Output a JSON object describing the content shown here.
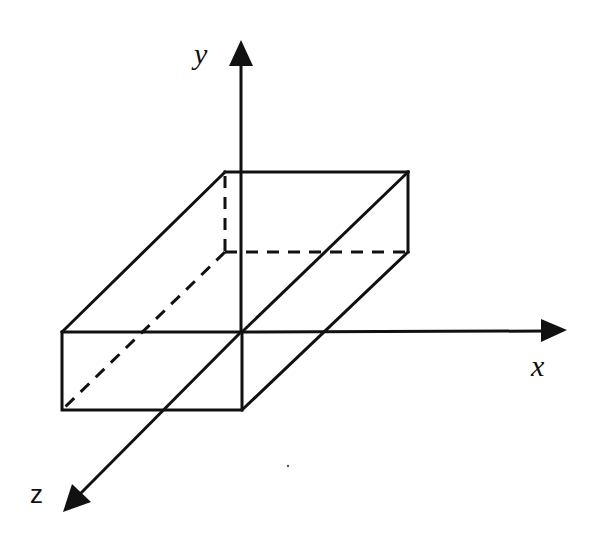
{
  "diagram": {
    "type": "3d-axes-box",
    "axes": {
      "x": {
        "label": "x",
        "icon": "arrow-right-icon"
      },
      "y": {
        "label": "y",
        "icon": "arrow-up-icon"
      },
      "z": {
        "label": "z",
        "icon": "arrow-down-left-icon"
      }
    },
    "shape": "rectangular-box",
    "hidden_edges": "dashed",
    "colors": {
      "stroke": "#111111",
      "background": "#ffffff"
    }
  }
}
